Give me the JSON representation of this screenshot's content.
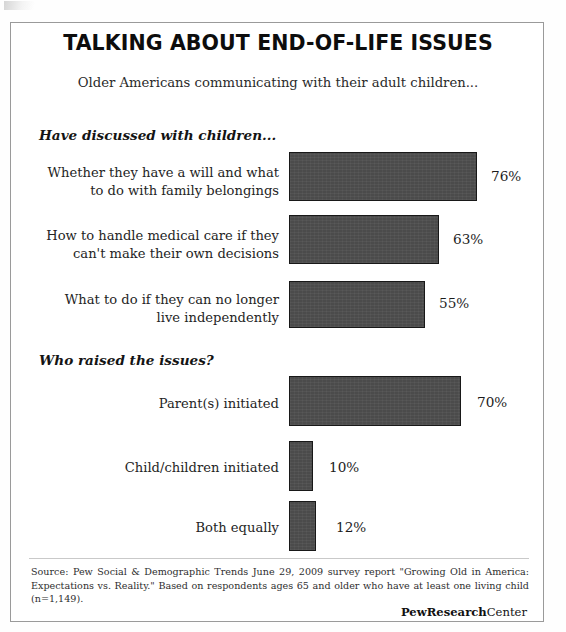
{
  "figure": {
    "title": "TALKING ABOUT END-OF-LIFE ISSUES",
    "subtitle": "Older Americans communicating with their adult children..."
  },
  "sections": [
    {
      "heading": "Have discussed with children..."
    },
    {
      "heading": "Who raised the issues?"
    }
  ],
  "rows": [
    {
      "label": "Whether they have a will and what\nto do with family belongings",
      "value_label": "76%"
    },
    {
      "label": "How to handle medical care if they\ncan't make their own decisions",
      "value_label": "63%"
    },
    {
      "label": "What to do if they can no longer\nlive independently",
      "value_label": "55%"
    },
    {
      "label": "Parent(s) initiated",
      "value_label": "70%"
    },
    {
      "label": "Child/children initiated",
      "value_label": "10%"
    },
    {
      "label": "Both equally",
      "value_label": "12%"
    }
  ],
  "footer": {
    "source": "Source: Pew Social & Demographic Trends June 29, 2009 survey report \"Growing Old in America: Expectations vs. Reality.\" Based on respondents ages 65 and older who have at least one living child (n=1,149).",
    "brand_bold": "PewResearch",
    "brand_light": "Center"
  },
  "chart_data": {
    "type": "bar",
    "orientation": "horizontal",
    "title": "TALKING ABOUT END-OF-LIFE ISSUES",
    "subtitle": "Older Americans communicating with their adult children...",
    "xlabel": "",
    "ylabel": "",
    "xlim": [
      0,
      80
    ],
    "grid": false,
    "legend": null,
    "value_suffix": "%",
    "bar_color": "#4b4b4b",
    "bar_border_color": "#181818",
    "groups": [
      {
        "name": "Have discussed with children...",
        "categories": [
          "Whether they have a will and what to do with family belongings",
          "How to handle medical care if they can't make their own decisions",
          "What to do if they can no longer live independently"
        ],
        "values": [
          76,
          63,
          55
        ]
      },
      {
        "name": "Who raised the issues?",
        "categories": [
          "Parent(s) initiated",
          "Child/children initiated",
          "Both equally"
        ],
        "values": [
          70,
          10,
          12
        ]
      }
    ],
    "categories": [
      "Whether they have a will and what to do with family belongings",
      "How to handle medical care if they can't make their own decisions",
      "What to do if they can no longer live independently",
      "Parent(s) initiated",
      "Child/children initiated",
      "Both equally"
    ],
    "values": [
      76,
      63,
      55,
      70,
      10,
      12
    ],
    "annotations": [
      "Source: Pew Social & Demographic Trends June 29, 2009 survey report \"Growing Old in America: Expectations vs. Reality.\" Based on respondents ages 65 and older who have at least one living child (n=1,149).",
      "PewResearchCenter"
    ]
  },
  "layout": {
    "bars": [
      {
        "top": 129,
        "height": 49,
        "width": 188,
        "label_top": 141,
        "value_left": 480,
        "value_top": 145
      },
      {
        "top": 192,
        "height": 49,
        "width": 150,
        "label_top": 204,
        "value_left": 442,
        "value_top": 208
      },
      {
        "top": 258,
        "height": 47,
        "width": 136,
        "label_top": 268,
        "value_left": 428,
        "value_top": 272
      },
      {
        "top": 353,
        "height": 50,
        "width": 172,
        "label_top": 372,
        "value_left": 466,
        "value_top": 371
      },
      {
        "top": 418,
        "height": 50,
        "width": 24,
        "label_top": 436,
        "value_left": 318,
        "value_top": 436
      },
      {
        "top": 478,
        "height": 50,
        "width": 27,
        "label_top": 496,
        "value_left": 325,
        "value_top": 496
      }
    ]
  }
}
